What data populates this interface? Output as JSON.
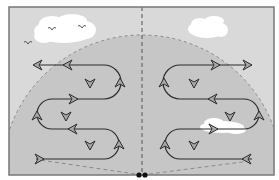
{
  "diagram": {
    "colors": {
      "page_bg": "#ffffff",
      "frame_bg": "#d9d9d9",
      "fan_bg": "#c8c8c8",
      "frame_border": "#777777",
      "path_stroke": "#2b2b2b",
      "arrow_fill": "#a9a9a9",
      "dash_stroke": "#8a8a8a",
      "cloud": "#ffffff",
      "bird": "#555555"
    },
    "frame": {
      "x": 9,
      "y": 7,
      "width": 265,
      "height": 168
    },
    "fan": {
      "cx": 142,
      "cy": 175,
      "r": 140
    },
    "center_line": {
      "x": 142,
      "y1": 7,
      "y2": 175
    },
    "origin_marker": {
      "x": 142,
      "y": 175
    },
    "clouds": [
      {
        "name": "cloud-left",
        "x": 33,
        "y": 16,
        "w": 62,
        "h": 29
      },
      {
        "name": "cloud-right",
        "x": 187,
        "y": 17,
        "w": 41,
        "h": 23
      },
      {
        "name": "cloud-lower-right",
        "x": 200,
        "y": 117,
        "w": 48,
        "h": 18
      }
    ],
    "birds": [
      {
        "x": 52,
        "y": 29
      },
      {
        "x": 82,
        "y": 27
      },
      {
        "x": 28,
        "y": 42
      }
    ],
    "paths": [
      {
        "name": "left-flight-path",
        "rows_y": [
          65,
          99,
          129,
          159
        ],
        "loops": [
          {
            "cx": 104,
            "cy": 82,
            "r": 17,
            "side": "right"
          },
          {
            "cx": 52,
            "cy": 114,
            "r": 15,
            "side": "left"
          },
          {
            "cx": 104,
            "cy": 144,
            "r": 15,
            "side": "right"
          }
        ]
      },
      {
        "name": "right-flight-path",
        "rows_y": [
          65,
          99,
          129,
          159
        ],
        "loops": [
          {
            "cx": 180,
            "cy": 82,
            "r": 17,
            "side": "left"
          },
          {
            "cx": 244,
            "cy": 114,
            "r": 15,
            "side": "right"
          },
          {
            "cx": 180,
            "cy": 144,
            "r": 15,
            "side": "left"
          }
        ]
      }
    ]
  }
}
